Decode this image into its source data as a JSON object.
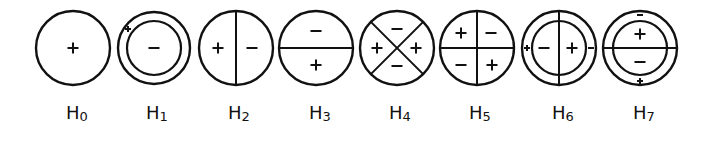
{
  "figure": {
    "stroke_color": "#111111",
    "background": "#ffffff",
    "items": [
      {
        "id": "H0",
        "label": "H",
        "sub": "0",
        "cx": 73,
        "cy": 48,
        "r": 37,
        "inner_r": null,
        "divider": "none",
        "signs": [
          {
            "t": "+",
            "dx": 0,
            "dy": 0
          }
        ]
      },
      {
        "id": "H1",
        "label": "H",
        "sub": "1",
        "cx": 154,
        "cy": 48,
        "r": 36,
        "inner_r": 27,
        "divider": "none",
        "signs": [
          {
            "t": "-",
            "dx": 0,
            "dy": 0
          },
          {
            "t": "+",
            "dx": -26,
            "dy": -19,
            "small": true
          }
        ]
      },
      {
        "id": "H2",
        "label": "H",
        "sub": "2",
        "cx": 236,
        "cy": 48,
        "r": 37,
        "inner_r": null,
        "divider": "vertical",
        "signs": [
          {
            "t": "+",
            "dx": -18,
            "dy": 0
          },
          {
            "t": "-",
            "dx": 16,
            "dy": 0
          }
        ]
      },
      {
        "id": "H3",
        "label": "H",
        "sub": "3",
        "cx": 316,
        "cy": 48,
        "r": 37,
        "inner_r": null,
        "divider": "horizontal",
        "signs": [
          {
            "t": "-",
            "dx": 0,
            "dy": -17
          },
          {
            "t": "+",
            "dx": 0,
            "dy": 17
          }
        ]
      },
      {
        "id": "H4",
        "label": "H",
        "sub": "4",
        "cx": 397,
        "cy": 48,
        "r": 37,
        "inner_r": null,
        "divider": "diagonal-x",
        "signs": [
          {
            "t": "-",
            "dx": 0,
            "dy": -19
          },
          {
            "t": "+",
            "dx": -20,
            "dy": 0
          },
          {
            "t": "+",
            "dx": 19,
            "dy": 0
          },
          {
            "t": "-",
            "dx": 0,
            "dy": 18
          }
        ]
      },
      {
        "id": "H5",
        "label": "H",
        "sub": "5",
        "cx": 477,
        "cy": 48,
        "r": 37,
        "inner_r": null,
        "divider": "cross",
        "signs": [
          {
            "t": "+",
            "dx": -16,
            "dy": -15
          },
          {
            "t": "-",
            "dx": 14,
            "dy": -15
          },
          {
            "t": "-",
            "dx": -16,
            "dy": 17
          },
          {
            "t": "+",
            "dx": 15,
            "dy": 17
          }
        ]
      },
      {
        "id": "H6",
        "label": "H",
        "sub": "6",
        "cx": 559,
        "cy": 48,
        "r": 37,
        "inner_r": 27,
        "divider": "vertical-full",
        "signs": [
          {
            "t": "-",
            "dx": -15,
            "dy": 0
          },
          {
            "t": "+",
            "dx": 13,
            "dy": 0
          },
          {
            "t": "+",
            "dx": -32,
            "dy": 0,
            "small": true
          },
          {
            "t": "-",
            "dx": 32,
            "dy": 0,
            "small": true
          }
        ]
      },
      {
        "id": "H7",
        "label": "H",
        "sub": "7",
        "cx": 640,
        "cy": 48,
        "r": 37,
        "inner_r": 27,
        "divider": "horizontal-full",
        "signs": [
          {
            "t": "+",
            "dx": 0,
            "dy": -14
          },
          {
            "t": "-",
            "dx": 0,
            "dy": 14
          },
          {
            "t": "-",
            "dx": 0,
            "dy": -33,
            "small": true
          },
          {
            "t": "+",
            "dx": 0,
            "dy": 33,
            "small": true
          }
        ]
      }
    ]
  },
  "labels": {
    "H0": {
      "main": "H",
      "sub": "0",
      "x": 66
    },
    "H1": {
      "main": "H",
      "sub": "1",
      "x": 146
    },
    "H2": {
      "main": "H",
      "sub": "2",
      "x": 228
    },
    "H3": {
      "main": "H",
      "sub": "3",
      "x": 309
    },
    "H4": {
      "main": "H",
      "sub": "4",
      "x": 389
    },
    "H5": {
      "main": "H",
      "sub": "5",
      "x": 469
    },
    "H6": {
      "main": "H",
      "sub": "6",
      "x": 552
    },
    "H7": {
      "main": "H",
      "sub": "7",
      "x": 633
    }
  }
}
